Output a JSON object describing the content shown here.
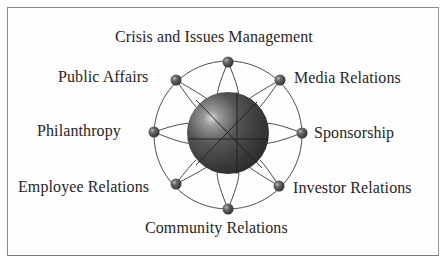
{
  "diagram": {
    "hub": {
      "name": "central-sphere"
    },
    "nodes": [
      {
        "id": "crisis",
        "label": "Crisis and Issues Management",
        "angle_deg": 270
      },
      {
        "id": "media",
        "label": "Media Relations",
        "angle_deg": 315
      },
      {
        "id": "sponsorship",
        "label": "Sponsorship",
        "angle_deg": 0
      },
      {
        "id": "investor",
        "label": "Investor Relations",
        "angle_deg": 45
      },
      {
        "id": "community",
        "label": "Community Relations",
        "angle_deg": 90
      },
      {
        "id": "employee",
        "label": "Employee Relations",
        "angle_deg": 135
      },
      {
        "id": "philanthropy",
        "label": "Philanthropy",
        "angle_deg": 180
      },
      {
        "id": "public",
        "label": "Public Affairs",
        "angle_deg": 225
      }
    ],
    "colors": {
      "sphere_dark": "#2e2e2e",
      "sphere_mid": "#555555",
      "sphere_highlight": "#d8d8d8",
      "line": "#3a3a3a",
      "text": "#262626",
      "frame": "#8a8a8a"
    }
  }
}
